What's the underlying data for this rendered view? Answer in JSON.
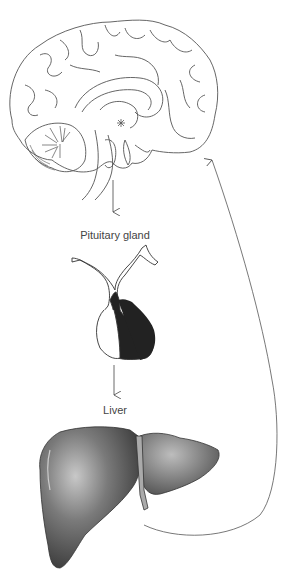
{
  "diagram": {
    "nodes": [
      {
        "id": "brain",
        "label": ""
      },
      {
        "id": "pituitary",
        "label": "Pituitary gland"
      },
      {
        "id": "liver",
        "label": "Liver"
      }
    ],
    "edges": [
      {
        "from": "brain",
        "to": "pituitary"
      },
      {
        "from": "pituitary",
        "to": "liver"
      },
      {
        "from": "liver",
        "to": "brain"
      }
    ]
  },
  "labels": {
    "pituitary": "Pituitary gland",
    "liver": "Liver"
  },
  "colors": {
    "line": "#555555",
    "fill_dark": "#222222",
    "liver_fill": "#6a6a6a"
  }
}
